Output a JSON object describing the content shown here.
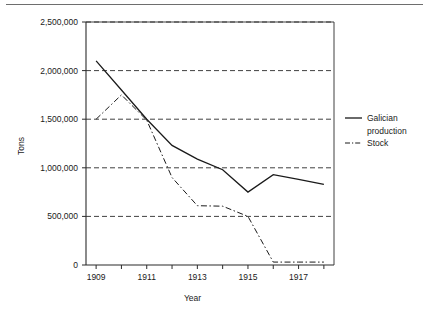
{
  "figure": {
    "has_top_rule": true
  },
  "chart_data": {
    "type": "line",
    "title": "",
    "xlabel": "Year",
    "ylabel": "Tons",
    "x": [
      1909,
      1910,
      1911,
      1912,
      1913,
      1914,
      1915,
      1916,
      1917,
      1918
    ],
    "xtick_labels": [
      "1909",
      "1911",
      "1913",
      "1915",
      "1917"
    ],
    "xtick_values": [
      1909,
      1911,
      1913,
      1915,
      1917
    ],
    "xlim": [
      1908.6,
      1918.4
    ],
    "ytick_labels": [
      "0",
      "500,000",
      "1,000,000",
      "1,500,000",
      "2,000,000",
      "2,500,000"
    ],
    "ytick_values": [
      0,
      500000,
      1000000,
      1500000,
      2000000,
      2500000
    ],
    "ylim": [
      0,
      2500000
    ],
    "grid": "horizontal-dashed",
    "legend_position": "right",
    "series": [
      {
        "name": "Galician production",
        "style": "solid",
        "color": "#1a1a1a",
        "values": [
          2100000,
          1800000,
          1500000,
          1230000,
          1090000,
          980000,
          750000,
          930000,
          880000,
          830000
        ]
      },
      {
        "name": "Stock",
        "style": "dash-dot",
        "color": "#1a1a1a",
        "values": [
          1500000,
          1750000,
          1490000,
          900000,
          610000,
          605000,
          500000,
          30000,
          30000,
          30000
        ]
      }
    ]
  },
  "legend": {
    "entries": [
      {
        "label_line1": "Galician",
        "label_line2": "production",
        "style": "solid"
      },
      {
        "label_line1": "Stock",
        "label_line2": "",
        "style": "dash-dot"
      }
    ]
  }
}
